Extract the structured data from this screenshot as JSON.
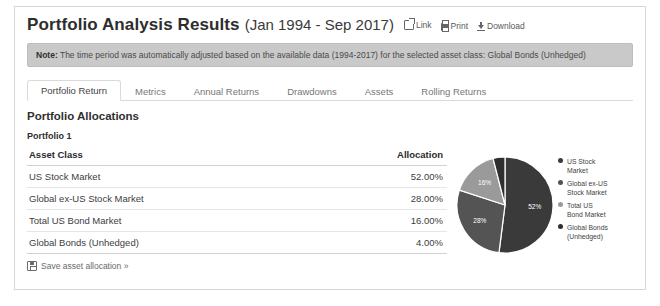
{
  "header": {
    "title": "Portfolio Analysis Results",
    "range": "(Jan 1994 - Sep 2017)",
    "links": [
      {
        "label": "Link",
        "icon": "external-link-icon"
      },
      {
        "label": "Print",
        "icon": "printer-icon"
      },
      {
        "label": "Download",
        "icon": "download-icon"
      }
    ]
  },
  "note": {
    "prefix": "Note:",
    "text": " The time period was automatically adjusted based on the available data (1994-2017) for the selected asset class: Global Bonds (Unhedged)"
  },
  "tabs": [
    {
      "label": "Portfolio Return",
      "active": true
    },
    {
      "label": "Metrics",
      "active": false
    },
    {
      "label": "Annual Returns",
      "active": false
    },
    {
      "label": "Drawdowns",
      "active": false
    },
    {
      "label": "Assets",
      "active": false
    },
    {
      "label": "Rolling Returns",
      "active": false
    }
  ],
  "main": {
    "section_title": "Portfolio Allocations",
    "portfolio_label": "Portfolio 1",
    "table": {
      "columns": [
        "Asset Class",
        "Allocation"
      ],
      "rows": [
        {
          "asset": "US Stock Market",
          "allocation": "52.00%"
        },
        {
          "asset": "Global ex-US Stock Market",
          "allocation": "28.00%"
        },
        {
          "asset": "Total US Bond Market",
          "allocation": "16.00%"
        },
        {
          "asset": "Global Bonds (Unhedged)",
          "allocation": "4.00%"
        }
      ]
    },
    "save_link": "Save asset allocation »"
  },
  "chart_data": {
    "type": "pie",
    "title": "",
    "categories": [
      "US Stock Market",
      "Global ex-US Stock Market",
      "Total US Bond Market",
      "Global Bonds (Unhedged)"
    ],
    "values": [
      52,
      28,
      16,
      4
    ],
    "data_labels": [
      "52%",
      "28%",
      "16%",
      ""
    ],
    "colors": [
      "#3a3a3a",
      "#545454",
      "#9a9a9a",
      "#2f2f2f"
    ],
    "legend_position": "right",
    "legend": [
      {
        "label_line1": "US Stock",
        "label_line2": "Market",
        "color": "#3a3a3a"
      },
      {
        "label_line1": "Global ex-US",
        "label_line2": "Stock Market",
        "color": "#545454"
      },
      {
        "label_line1": "Total US",
        "label_line2": "Bond Market",
        "color": "#9a9a9a"
      },
      {
        "label_line1": "Global Bonds",
        "label_line2": "(Unhedged)",
        "color": "#2f2f2f"
      }
    ]
  }
}
